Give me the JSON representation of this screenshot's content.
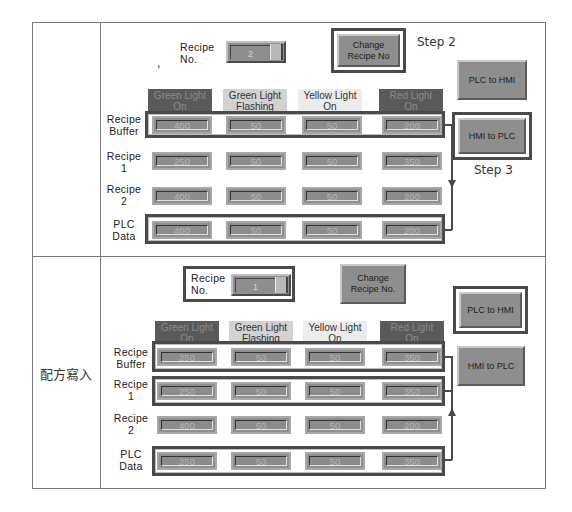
{
  "table": {
    "row2_label": "配方寫入"
  },
  "top": {
    "dot": ",",
    "recipe_no_label": "Recipe\nNo.",
    "recipe_no_value": "2",
    "change_button": "Change\nRecipe No",
    "step2": "Step 2",
    "plc_to_hmi": "PLC to HMI",
    "hmi_to_plc": "HMI to PLC",
    "step3": "Step 3",
    "columns": [
      "Green Light\nOn",
      "Green Light\nFlashing",
      "Yellow Light\nOn",
      "Red Light\nOn"
    ],
    "rows": [
      {
        "label": "Recipe\nBuffer",
        "values": [
          "400",
          "50",
          "50",
          "200"
        ]
      },
      {
        "label": "Recipe\n1",
        "values": [
          "250",
          "50",
          "50",
          "350"
        ]
      },
      {
        "label": "Recipe\n2",
        "values": [
          "400",
          "50",
          "50",
          "200"
        ]
      },
      {
        "label": "PLC\nData",
        "values": [
          "400",
          "50",
          "50",
          "200"
        ]
      }
    ]
  },
  "bottom": {
    "recipe_no_label": "Recipe\nNo.",
    "recipe_no_value": "1",
    "change_button": "Change\nRecipe No.",
    "plc_to_hmi": "PLC to HMI",
    "hmi_to_plc": "HMI to PLC",
    "columns": [
      "Green Light\nOn",
      "Green Light\nFlashing",
      "Yellow Light\nOn",
      "Red Light\nOn"
    ],
    "rows": [
      {
        "label": "Recipe\nBuffer",
        "values": [
          "250",
          "50",
          "50",
          "350"
        ]
      },
      {
        "label": "Recipe\n1",
        "values": [
          "250",
          "50",
          "50",
          "350"
        ]
      },
      {
        "label": "Recipe\n2",
        "values": [
          "400",
          "50",
          "50",
          "200"
        ]
      },
      {
        "label": "PLC\nData",
        "values": [
          "250",
          "50",
          "50",
          "350"
        ]
      }
    ]
  },
  "colors": {
    "header_dark": "#5a5a5a",
    "header_light": "#d2d2d2",
    "header_pale": "#ececec",
    "field": "#8c8c8c",
    "frame": "#4a4a4a"
  }
}
